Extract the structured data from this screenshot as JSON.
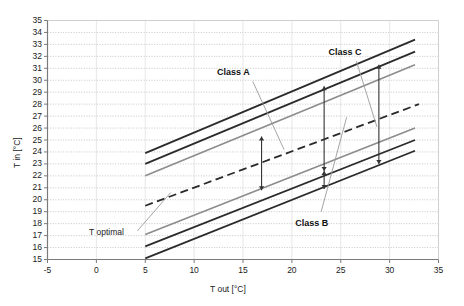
{
  "chart_data": {
    "type": "line",
    "title": "",
    "xlabel": "T out [°C]",
    "ylabel": "T in [°C]",
    "xlim": [
      -5,
      35
    ],
    "ylim": [
      15,
      35
    ],
    "xticks": [
      -5,
      0,
      5,
      10,
      15,
      20,
      25,
      30,
      35
    ],
    "xtick_labels": [
      "-5",
      "0",
      "5",
      "10",
      "15",
      "20",
      "25",
      "30",
      "35"
    ],
    "yticks": [
      15,
      16,
      17,
      18,
      19,
      20,
      21,
      22,
      23,
      24,
      25,
      26,
      27,
      28,
      29,
      30,
      31,
      32,
      33,
      34,
      35
    ],
    "ytick_labels": [
      "15",
      "16",
      "17",
      "18",
      "19",
      "20",
      "21",
      "22",
      "23",
      "24",
      "25",
      "26",
      "27",
      "28",
      "29",
      "30",
      "31",
      "32",
      "33",
      "34",
      "35"
    ],
    "grid": "horizontal-dotted",
    "legend": "none",
    "series": [
      {
        "name": "Class C upper",
        "style": "solid-dark",
        "color": "#2b2b2b",
        "width": 1.8,
        "x": [
          5,
          32.6
        ],
        "y": [
          23.9,
          33.4
        ]
      },
      {
        "name": "Class A upper / Class B upper",
        "style": "solid-dark",
        "color": "#2b2b2b",
        "width": 1.8,
        "x": [
          5,
          32.6
        ],
        "y": [
          23.0,
          32.4
        ]
      },
      {
        "name": "Class A upper inner",
        "style": "solid-gray",
        "color": "#8c8c8c",
        "width": 1.6,
        "x": [
          5,
          32.6
        ],
        "y": [
          22.0,
          31.3
        ]
      },
      {
        "name": "T optimal",
        "style": "dashed",
        "color": "#2b2b2b",
        "width": 1.8,
        "x": [
          5,
          33.0
        ],
        "y": [
          19.5,
          28.0
        ]
      },
      {
        "name": "Class A lower inner",
        "style": "solid-gray",
        "color": "#8c8c8c",
        "width": 1.6,
        "x": [
          5,
          32.6
        ],
        "y": [
          17.1,
          26.0
        ]
      },
      {
        "name": "Class B lower",
        "style": "solid-dark",
        "color": "#2b2b2b",
        "width": 1.8,
        "x": [
          5,
          32.6
        ],
        "y": [
          16.1,
          25.0
        ]
      },
      {
        "name": "Class C lower",
        "style": "solid-dark",
        "color": "#2b2b2b",
        "width": 1.8,
        "x": [
          5,
          32.6
        ],
        "y": [
          15.1,
          24.1
        ]
      }
    ],
    "annotations": [
      {
        "label": "Class A",
        "x": 14.6,
        "y": 30.6,
        "type": "callout"
      },
      {
        "label": "Class C",
        "x": 26.0,
        "y": 32.3,
        "type": "callout"
      },
      {
        "label": "Class B",
        "x": 22.6,
        "y": 18.0,
        "type": "callout"
      },
      {
        "label": "T optimal",
        "x": 1.5,
        "y": 17.2,
        "type": "callout"
      }
    ],
    "range_bars": [
      {
        "name": "range-bar-class-a",
        "x": 16.9,
        "y_top": 25.3,
        "y_bottom": 20.8
      },
      {
        "name": "range-bar-class-b",
        "x": 23.3,
        "y_top": 29.5,
        "y_bottom": 22.4
      },
      {
        "name": "range-bar-class-b-lower",
        "x": 23.3,
        "y_top": 22.4,
        "y_bottom": 20.9
      },
      {
        "name": "range-bar-class-c",
        "x": 28.9,
        "y_top": 31.3,
        "y_bottom": 23.0
      }
    ]
  },
  "colors": {
    "dark_line": "#2b2b2b",
    "gray_line": "#8c8c8c",
    "axis": "#7a7a7a",
    "grid": "#b9b9b9",
    "text": "#1a1a1a",
    "background": "#ffffff"
  }
}
